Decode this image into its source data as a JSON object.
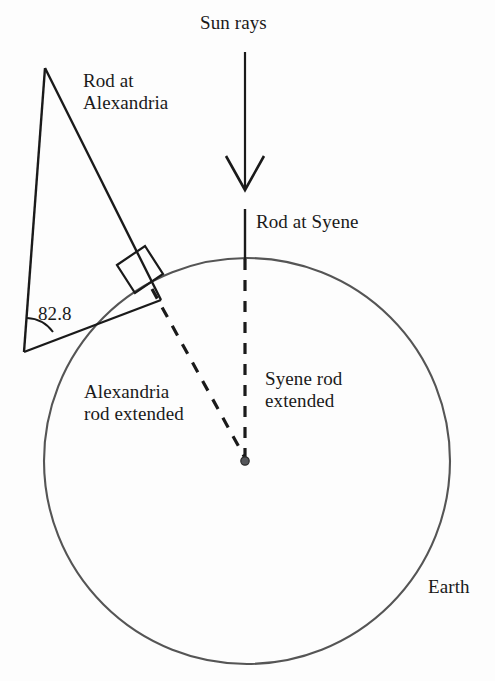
{
  "diagram": {
    "labels": {
      "sun_rays": "Sun rays",
      "rod_at_alexandria": "Rod at\nAlexandria",
      "rod_at_syene": "Rod at Syene",
      "angle_value": "82.8",
      "alexandria_rod_extended": "Alexandria\nrod extended",
      "syene_rod_extended": "Syene rod\nextended",
      "earth": "Earth"
    },
    "colors": {
      "background": "#fdfdfd",
      "line": "#1a1a1a",
      "earth_circle": "#555555",
      "text": "#1a1a1a",
      "center_dot": "#4a4a4a"
    },
    "geometry": {
      "earth_circle": {
        "cx": 247,
        "cy": 461,
        "r": 203
      },
      "center_dot": {
        "cx": 245,
        "cy": 462,
        "r": 4
      },
      "triangle": {
        "apex": {
          "x": 45,
          "y": 68
        },
        "bottom_left": {
          "x": 24,
          "y": 352
        },
        "tangent_point": {
          "x": 152,
          "y": 289
        }
      },
      "right_angle_marker": {
        "size": 30
      },
      "angle_arc": {
        "radius": 30,
        "value_degrees": 82.8
      },
      "sun_ray_arrow": {
        "x": 245,
        "y_start": 52,
        "y_end": 190
      },
      "syene_rod_solid": {
        "x": 245,
        "y_start": 209,
        "y_end": 259
      },
      "syene_rod_dashed": {
        "x": 245,
        "y_start": 259,
        "y_end": 459
      },
      "alexandria_rod_dashed": {
        "x1": 152,
        "y1": 289,
        "x2": 245,
        "y2": 459
      }
    }
  }
}
